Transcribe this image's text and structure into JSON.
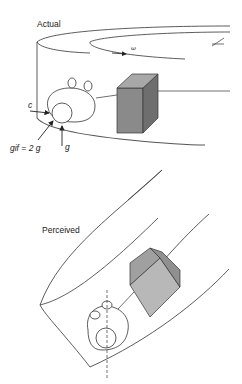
{
  "diagram": {
    "panels": [
      {
        "id": "actual",
        "label": "Actual",
        "annotations": {
          "rotation_symbol": "ω",
          "force_c": "c",
          "force_gif": "gif = 2 g",
          "force_g": "g"
        }
      },
      {
        "id": "perceived",
        "label": "Perceived"
      }
    ],
    "colors": {
      "line": "#333333",
      "box_front": "#8a8a8a",
      "box_side": "#6e6e6e",
      "box_top": "#a8a8a8",
      "box2_front": "#b8b8b8",
      "box2_side": "#909090",
      "box2_top": "#a0a0a0"
    }
  }
}
